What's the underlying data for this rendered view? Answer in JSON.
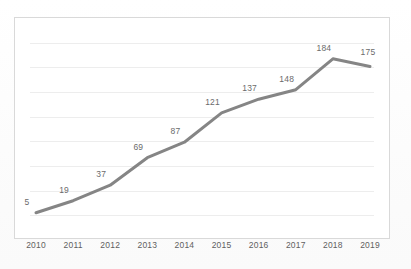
{
  "figure": {
    "background_color": "#ffffff",
    "frame_color": "#d9d9d9",
    "gridline_color": "#ededed",
    "caption": ""
  },
  "chart_data": {
    "type": "line",
    "title": "",
    "subtitle": "",
    "xlabel": "",
    "ylabel": "",
    "categories": [
      "2010",
      "2011",
      "2012",
      "2013",
      "2014",
      "2015",
      "2016",
      "2017",
      "2018",
      "2019"
    ],
    "values": [
      5,
      19,
      37,
      69,
      87,
      121,
      137,
      148,
      184,
      175
    ],
    "data_labels": [
      "5",
      "19",
      "37",
      "69",
      "87",
      "121",
      "137",
      "148",
      "184",
      "175"
    ],
    "series": [
      {
        "name": "",
        "color": "#858585",
        "line_width": 3,
        "marker": "none",
        "values": [
          5,
          19,
          37,
          69,
          87,
          121,
          137,
          148,
          184,
          175
        ]
      }
    ],
    "ylim": [
      0,
      200
    ],
    "xlim": [
      "2010",
      "2019"
    ],
    "y_tick_labels": [],
    "x_tick_labels": [
      "2010",
      "2011",
      "2012",
      "2013",
      "2014",
      "2015",
      "2016",
      "2017",
      "2018",
      "2019"
    ],
    "gridlines": {
      "horizontal": true,
      "vertical": false,
      "count": 8
    },
    "legend": {
      "visible": false,
      "position": "none",
      "entries": []
    },
    "data_labels_visible": true,
    "data_label_position": "above-left"
  }
}
